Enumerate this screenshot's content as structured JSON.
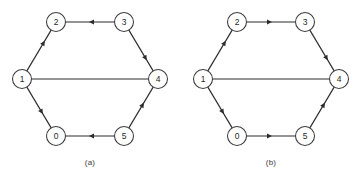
{
  "figure": {
    "panels": [
      {
        "id": "a",
        "caption": "(a)",
        "nodes": [
          {
            "id": "1",
            "label": "1",
            "x": 22,
            "y": 79
          },
          {
            "id": "2",
            "label": "2",
            "x": 56,
            "y": 22
          },
          {
            "id": "3",
            "label": "3",
            "x": 124,
            "y": 22
          },
          {
            "id": "4",
            "label": "4",
            "x": 158,
            "y": 79
          },
          {
            "id": "5",
            "label": "5",
            "x": 124,
            "y": 136
          },
          {
            "id": "0",
            "label": "0",
            "x": 56,
            "y": 136
          }
        ],
        "edges": [
          {
            "from": "1",
            "to": "2",
            "directed": true,
            "arrow_at": 0.74
          },
          {
            "from": "3",
            "to": "2",
            "directed": true,
            "arrow_at": 0.52
          },
          {
            "from": "3",
            "to": "4",
            "directed": true,
            "arrow_at": 0.74
          },
          {
            "from": "1",
            "to": "4",
            "directed": false,
            "arrow_at": 0.5
          },
          {
            "from": "5",
            "to": "4",
            "directed": true,
            "arrow_at": 0.62
          },
          {
            "from": "5",
            "to": "0",
            "directed": true,
            "arrow_at": 0.52
          },
          {
            "from": "1",
            "to": "0",
            "directed": true,
            "arrow_at": 0.66
          }
        ]
      },
      {
        "id": "b",
        "caption": "(b)",
        "nodes": [
          {
            "id": "1",
            "label": "1",
            "x": 22,
            "y": 79
          },
          {
            "id": "2",
            "label": "2",
            "x": 56,
            "y": 22
          },
          {
            "id": "3",
            "label": "3",
            "x": 124,
            "y": 22
          },
          {
            "id": "4",
            "label": "4",
            "x": 158,
            "y": 79
          },
          {
            "id": "5",
            "label": "5",
            "x": 124,
            "y": 136
          },
          {
            "id": "0",
            "label": "0",
            "x": 56,
            "y": 136
          }
        ],
        "edges": [
          {
            "from": "1",
            "to": "2",
            "directed": true,
            "arrow_at": 0.74
          },
          {
            "from": "2",
            "to": "3",
            "directed": true,
            "arrow_at": 0.52
          },
          {
            "from": "3",
            "to": "4",
            "directed": true,
            "arrow_at": 0.74
          },
          {
            "from": "1",
            "to": "4",
            "directed": false,
            "arrow_at": 0.5
          },
          {
            "from": "5",
            "to": "4",
            "directed": true,
            "arrow_at": 0.62
          },
          {
            "from": "0",
            "to": "5",
            "directed": true,
            "arrow_at": 0.52
          },
          {
            "from": "1",
            "to": "0",
            "directed": true,
            "arrow_at": 0.66
          }
        ]
      }
    ],
    "style": {
      "node_radius": 9.5,
      "edge_color": "#2b2b2b",
      "node_stroke_color": "#3b3b3b",
      "node_fill_color": "#ffffff",
      "label_color": "#1f1f1f",
      "caption_color": "#3a3a3a",
      "background_color": "#ffffff"
    }
  }
}
